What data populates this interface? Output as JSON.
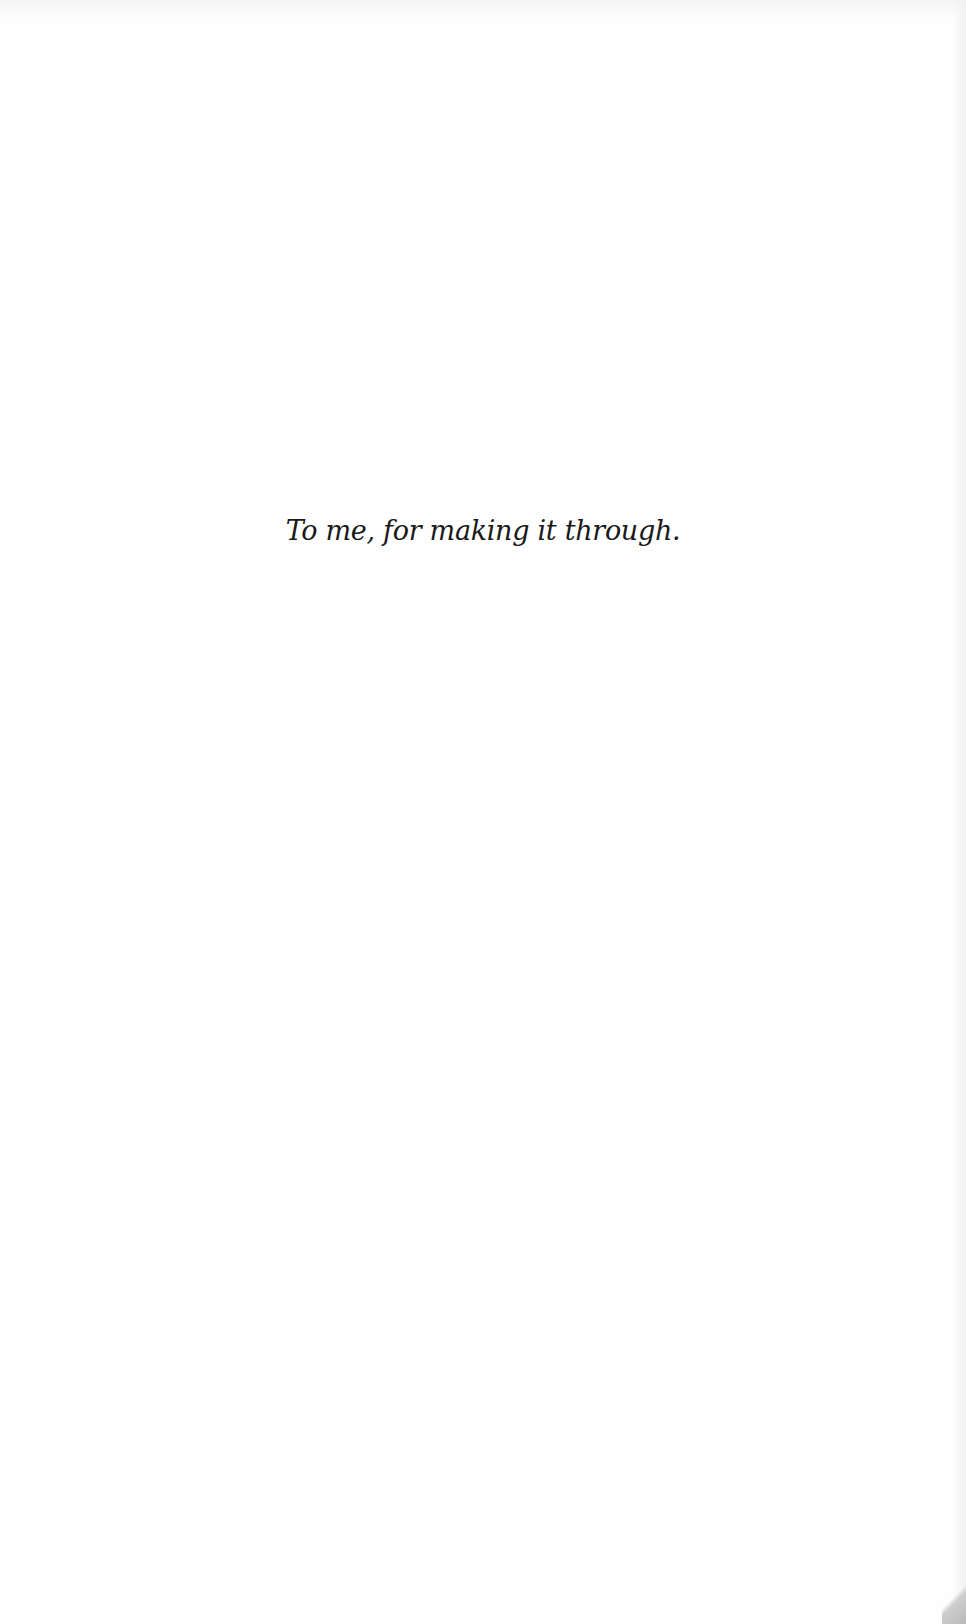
{
  "page": {
    "dedication": "To me, for making it through."
  }
}
